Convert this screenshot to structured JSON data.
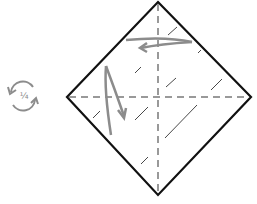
{
  "diagram": {
    "type": "origami-fold-step",
    "rotate_indicator": {
      "label": "¼",
      "icon": "rotate-quarter-icon"
    },
    "paper": {
      "shape": "diamond",
      "vertices": {
        "top": [
          158,
          2
        ],
        "left": [
          67,
          97
        ],
        "right": [
          251,
          97
        ],
        "bottom": [
          158,
          195
        ]
      }
    },
    "crease_lines": [
      "vertical-center-valley",
      "horizontal-center-valley"
    ],
    "arrows": [
      "fold-top-arrow-left",
      "fold-left-arrow-down"
    ],
    "colors": {
      "outline": "#111111",
      "crease": "#999999",
      "arrow": "#8c8c8c",
      "shading": "#333333"
    }
  }
}
